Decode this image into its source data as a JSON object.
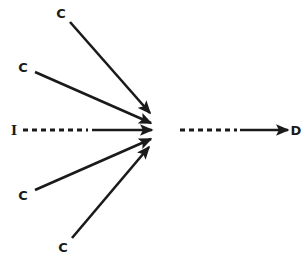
{
  "diagram": {
    "type": "convergence-flow-diagram",
    "background_color": "#ffffff",
    "stroke_color": "#1a1a1a",
    "canvas": {
      "width": 307,
      "height": 265
    },
    "convergence_point": {
      "x": 152,
      "y": 130
    },
    "nodes": [
      {
        "id": "c-top",
        "label": "C",
        "x": 61,
        "y": 13
      },
      {
        "id": "c-upper-left",
        "label": "C",
        "x": 23,
        "y": 67
      },
      {
        "id": "i-input",
        "label": "I",
        "x": 14,
        "y": 130
      },
      {
        "id": "c-lower-left",
        "label": "C",
        "x": 23,
        "y": 195
      },
      {
        "id": "c-bottom",
        "label": "C",
        "x": 63,
        "y": 247
      },
      {
        "id": "d-output",
        "label": "D",
        "x": 296,
        "y": 130
      }
    ],
    "edges": [
      {
        "id": "edge-c-top",
        "from": "c-top",
        "to": "convergence_point",
        "style": "solid",
        "arrowhead": "end",
        "x1": 70,
        "y1": 22,
        "x2": 150,
        "y2": 113
      },
      {
        "id": "edge-c-upper-left",
        "from": "c-upper-left",
        "to": "convergence_point",
        "style": "solid",
        "arrowhead": "end",
        "x1": 35,
        "y1": 72,
        "x2": 151,
        "y2": 123
      },
      {
        "id": "edge-i-input-dashed",
        "from": "i-input",
        "to": "convergence_point",
        "style": "dashed-then-solid",
        "arrowhead": "end",
        "x1": 23,
        "y1": 130,
        "x2": 152,
        "y2": 130,
        "dash_end_x": 88
      },
      {
        "id": "edge-c-lower-left",
        "from": "c-lower-left",
        "to": "convergence_point",
        "style": "solid",
        "arrowhead": "end",
        "x1": 35,
        "y1": 190,
        "x2": 151,
        "y2": 139
      },
      {
        "id": "edge-c-bottom",
        "from": "c-bottom",
        "to": "convergence_point",
        "style": "solid",
        "arrowhead": "end",
        "x1": 72,
        "y1": 238,
        "x2": 149,
        "y2": 147
      },
      {
        "id": "edge-output-d",
        "from": "convergence_point",
        "to": "d-output",
        "style": "dashed-then-solid",
        "arrowhead": "end",
        "x1": 180,
        "y1": 130,
        "x2": 288,
        "y2": 130,
        "dash_end_x": 237
      }
    ],
    "line_width": 2.6,
    "dash_pattern": "5 4"
  }
}
